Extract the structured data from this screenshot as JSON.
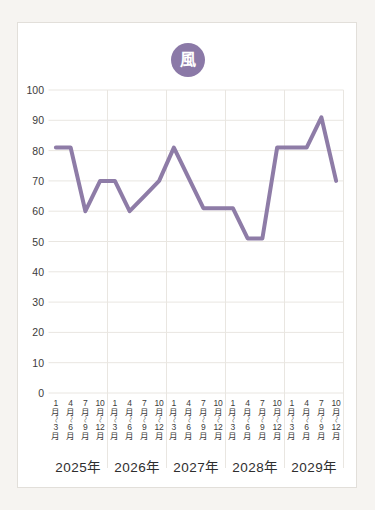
{
  "badge": {
    "label": "風",
    "color": "#8b79a7",
    "text_color": "#ffffff"
  },
  "chart_data": {
    "type": "line",
    "title": "",
    "xlabel": "",
    "ylabel": "",
    "ylim": [
      0,
      100
    ],
    "yticks": [
      100,
      90,
      80,
      70,
      60,
      50,
      40,
      30,
      20,
      10,
      0
    ],
    "grid": "on",
    "legend": "none",
    "line_color": "#8e7ca7",
    "grid_color": "#e9e6e1",
    "quarter_names": [
      "1月〜3月",
      "4月〜6月",
      "7月〜9月",
      "10月〜12月"
    ],
    "quarter_label_lines": [
      [
        "1",
        "月",
        "〜",
        "3",
        "月"
      ],
      [
        "4",
        "月",
        "〜",
        "6",
        "月"
      ],
      [
        "7",
        "月",
        "〜",
        "9",
        "月"
      ],
      [
        "10",
        "月",
        "〜",
        "12",
        "月"
      ]
    ],
    "years": [
      {
        "label": "2025年",
        "values": [
          81,
          81,
          60,
          70
        ]
      },
      {
        "label": "2026年",
        "values": [
          70,
          60,
          65,
          70
        ]
      },
      {
        "label": "2027年",
        "values": [
          81,
          71,
          61,
          61
        ]
      },
      {
        "label": "2028年",
        "values": [
          61,
          51,
          51,
          81
        ]
      },
      {
        "label": "2029年",
        "values": [
          81,
          81,
          91,
          70
        ]
      }
    ]
  }
}
